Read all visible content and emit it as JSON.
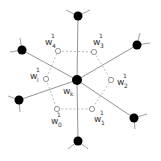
{
  "diagram": {
    "center": {
      "id": "wk",
      "x": 77,
      "y": 80,
      "label": "w",
      "subscript": "k"
    },
    "neighbors": [
      {
        "id": "n-top",
        "x": 78,
        "y": 16
      },
      {
        "id": "n-upper-right",
        "x": 137,
        "y": 45
      },
      {
        "id": "n-lower-right",
        "x": 134,
        "y": 118
      },
      {
        "id": "n-bottom",
        "x": 78,
        "y": 141
      },
      {
        "id": "n-lower-left",
        "x": 19,
        "y": 100
      },
      {
        "id": "n-upper-left",
        "x": 22,
        "y": 50
      }
    ],
    "open_points": [
      {
        "id": "w4",
        "x": 58,
        "y": 51,
        "label": "w",
        "sup": "1",
        "sub": "4"
      },
      {
        "id": "w3",
        "x": 94,
        "y": 52,
        "label": "w",
        "sup": "1",
        "sub": "3"
      },
      {
        "id": "wi",
        "x": 46,
        "y": 79,
        "label": "w",
        "sup": "1",
        "sub": "i"
      },
      {
        "id": "w2",
        "x": 111,
        "y": 80,
        "label": "w",
        "sup": "1",
        "sub": "2"
      },
      {
        "id": "w0",
        "x": 57,
        "y": 109,
        "label": "w",
        "sup": "1",
        "sub": "0"
      },
      {
        "id": "w1",
        "x": 92,
        "y": 109,
        "label": "w",
        "sup": "1",
        "sub": "1"
      }
    ],
    "labels": {
      "w4": {
        "base": "w",
        "sup": "1",
        "sub": "4"
      },
      "w3": {
        "base": "w",
        "sup": "1",
        "sub": "3"
      },
      "wi": {
        "base": "w",
        "sup": "1",
        "sub": "i"
      },
      "w2": {
        "base": "w",
        "sup": "1",
        "sub": "2"
      },
      "w0": {
        "base": "w",
        "sup": "1",
        "sub": "0"
      },
      "w1": {
        "base": "w",
        "sup": "1",
        "sub": "1"
      },
      "wk": {
        "base": "w",
        "sub": "k"
      }
    },
    "colors": {
      "node": "#000000",
      "edge": "#888888",
      "dashed": "#aaaaaa",
      "text": "#333333"
    }
  }
}
